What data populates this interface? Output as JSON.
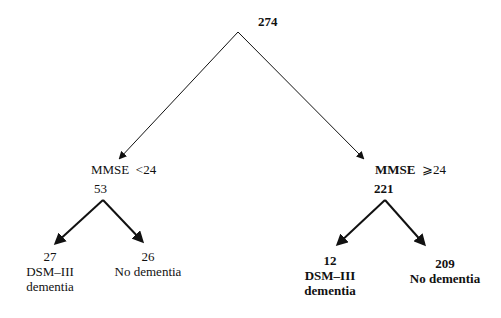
{
  "diagram": {
    "root": {
      "count": "274"
    },
    "branches": [
      {
        "condition": "MMSE <24",
        "condition_label": "MMSE",
        "condition_op": "<24",
        "count": "53",
        "children": [
          {
            "count": "27",
            "line1": "DSM–III",
            "line2": "dementia"
          },
          {
            "count": "26",
            "line1": "No dementia"
          }
        ]
      },
      {
        "condition": "MMSE ⩾24",
        "condition_label": "MMSE",
        "condition_op": "⩾24",
        "count": "221",
        "children": [
          {
            "count": "12",
            "line1": "DSM–III",
            "line2": "dementia"
          },
          {
            "count": "209",
            "line1": "No dementia"
          }
        ]
      }
    ]
  }
}
